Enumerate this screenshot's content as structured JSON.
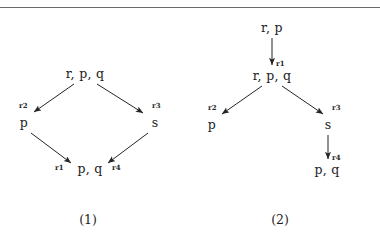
{
  "figure": {
    "separator_present": true,
    "ink_color": "#1d1d1d",
    "rule_color": "#6a6a6a",
    "diagrams": [
      {
        "id": "diagram-1",
        "caption": "(1)",
        "shape": "diamond",
        "nodes": [
          {
            "id": "n1-top",
            "label": "r, p, q"
          },
          {
            "id": "n1-left",
            "label": "p"
          },
          {
            "id": "n1-right",
            "label": "s"
          },
          {
            "id": "n1-bottom",
            "label": "p, q"
          }
        ],
        "edges": [
          {
            "from": "n1-top",
            "to": "n1-left",
            "label": "r2"
          },
          {
            "from": "n1-top",
            "to": "n1-right",
            "label": "r3"
          },
          {
            "from": "n1-left",
            "to": "n1-bottom",
            "label": "r1"
          },
          {
            "from": "n1-right",
            "to": "n1-bottom",
            "label": "r4"
          }
        ]
      },
      {
        "id": "diagram-2",
        "caption": "(2)",
        "shape": "tree",
        "nodes": [
          {
            "id": "n2-root",
            "label": "r, p"
          },
          {
            "id": "n2-mid",
            "label": "r, p, q"
          },
          {
            "id": "n2-left",
            "label": "p"
          },
          {
            "id": "n2-right",
            "label": "s"
          },
          {
            "id": "n2-leaf",
            "label": "p, q"
          }
        ],
        "edges": [
          {
            "from": "n2-root",
            "to": "n2-mid",
            "label": "r1"
          },
          {
            "from": "n2-mid",
            "to": "n2-left",
            "label": "r2"
          },
          {
            "from": "n2-mid",
            "to": "n2-right",
            "label": "r3"
          },
          {
            "from": "n2-right",
            "to": "n2-leaf",
            "label": "r4"
          }
        ]
      }
    ]
  }
}
